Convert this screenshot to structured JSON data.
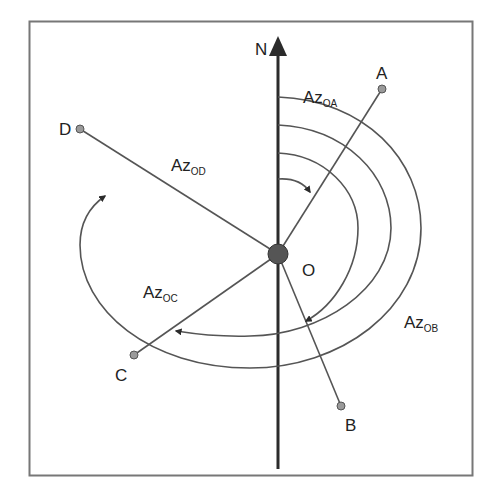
{
  "colors": {
    "line": "#555555",
    "north_axis": "#2b2b2b",
    "point_fill": "#9a9a9a",
    "origin_fill": "#555555",
    "frame": "#777777",
    "text": "#222222"
  },
  "north": {
    "label": "N"
  },
  "origin": {
    "label": "O"
  },
  "points": [
    {
      "id": "A",
      "label": "A"
    },
    {
      "id": "B",
      "label": "B"
    },
    {
      "id": "C",
      "label": "C"
    },
    {
      "id": "D",
      "label": "D"
    }
  ],
  "azimuths": [
    {
      "target": "A",
      "main": "Az",
      "sub": "OA"
    },
    {
      "target": "B",
      "main": "Az",
      "sub": "OB"
    },
    {
      "target": "C",
      "main": "Az",
      "sub": "OC"
    },
    {
      "target": "D",
      "main": "Az",
      "sub": "OD"
    }
  ]
}
